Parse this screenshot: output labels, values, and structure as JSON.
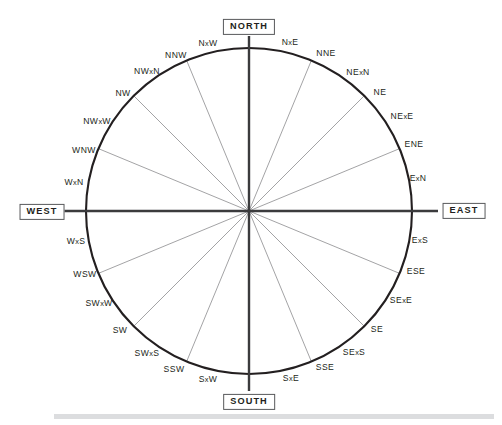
{
  "figure": {
    "name": "compass-rose",
    "center": {
      "x": 249,
      "y": 211
    },
    "radius": 163,
    "colors": {
      "circle_stroke": "#231f20",
      "cardinal_axis": "#3b3b3d",
      "ray_stroke": "#8b8b8e",
      "label_text": "#231f20",
      "box_border": "#58595b",
      "background": "#ffffff",
      "bottom_band": "#dcdddf"
    }
  },
  "cardinals": [
    {
      "id": "north",
      "label": "NORTH",
      "angle_deg": 0,
      "x": 249,
      "y": 27
    },
    {
      "id": "east",
      "label": "EAST",
      "angle_deg": 90,
      "x": 464,
      "y": 211
    },
    {
      "id": "south",
      "label": "SOUTH",
      "angle_deg": 180,
      "x": 249,
      "y": 402
    },
    {
      "id": "west",
      "label": "WEST",
      "angle_deg": 270,
      "x": 42,
      "y": 212
    }
  ],
  "points": [
    {
      "label": "NxE",
      "angle_deg": 11.25,
      "x": 290,
      "y": 42,
      "ray": false
    },
    {
      "label": "NNE",
      "angle_deg": 22.5,
      "x": 326,
      "y": 53,
      "ray": true
    },
    {
      "label": "NExN",
      "angle_deg": 33.75,
      "x": 358,
      "y": 72,
      "ray": false
    },
    {
      "label": "NE",
      "angle_deg": 45,
      "x": 380,
      "y": 92,
      "ray": true
    },
    {
      "label": "NExE",
      "angle_deg": 56.25,
      "x": 402,
      "y": 116,
      "ray": false
    },
    {
      "label": "ENE",
      "angle_deg": 67.5,
      "x": 414,
      "y": 144,
      "ray": true
    },
    {
      "label": "ExN",
      "angle_deg": 78.75,
      "x": 418,
      "y": 178,
      "ray": false
    },
    {
      "label": "ExS",
      "angle_deg": 101.25,
      "x": 420,
      "y": 240,
      "ray": false
    },
    {
      "label": "ESE",
      "angle_deg": 112.5,
      "x": 416,
      "y": 271,
      "ray": true
    },
    {
      "label": "SExE",
      "angle_deg": 123.75,
      "x": 401,
      "y": 300,
      "ray": false
    },
    {
      "label": "SE",
      "angle_deg": 135,
      "x": 377,
      "y": 329,
      "ray": true
    },
    {
      "label": "SExS",
      "angle_deg": 146.25,
      "x": 354,
      "y": 352,
      "ray": false
    },
    {
      "label": "SSE",
      "angle_deg": 157.5,
      "x": 325,
      "y": 367,
      "ray": true
    },
    {
      "label": "SxE",
      "angle_deg": 168.75,
      "x": 291,
      "y": 378,
      "ray": false
    },
    {
      "label": "SxW",
      "angle_deg": 191.25,
      "x": 208,
      "y": 379,
      "ray": false
    },
    {
      "label": "SSW",
      "angle_deg": 202.5,
      "x": 174,
      "y": 369,
      "ray": true
    },
    {
      "label": "SWxS",
      "angle_deg": 213.75,
      "x": 147,
      "y": 353,
      "ray": false
    },
    {
      "label": "SW",
      "angle_deg": 225,
      "x": 120,
      "y": 330,
      "ray": true
    },
    {
      "label": "SWxW",
      "angle_deg": 236.25,
      "x": 99,
      "y": 303,
      "ray": false
    },
    {
      "label": "WSW",
      "angle_deg": 247.5,
      "x": 85,
      "y": 274,
      "ray": true
    },
    {
      "label": "WxS",
      "angle_deg": 258.75,
      "x": 76,
      "y": 241,
      "ray": false
    },
    {
      "label": "WxN",
      "angle_deg": 281.25,
      "x": 74,
      "y": 182,
      "ray": false
    },
    {
      "label": "WNW",
      "angle_deg": 292.5,
      "x": 84,
      "y": 150,
      "ray": true
    },
    {
      "label": "NWxW",
      "angle_deg": 303.75,
      "x": 97,
      "y": 121,
      "ray": false
    },
    {
      "label": "NW",
      "angle_deg": 315,
      "x": 123,
      "y": 93,
      "ray": true
    },
    {
      "label": "NWxN",
      "angle_deg": 326.25,
      "x": 147,
      "y": 71,
      "ray": false
    },
    {
      "label": "NNW",
      "angle_deg": 337.5,
      "x": 176,
      "y": 55,
      "ray": true
    },
    {
      "label": "NxW",
      "angle_deg": 348.75,
      "x": 208,
      "y": 43,
      "ray": false
    }
  ]
}
